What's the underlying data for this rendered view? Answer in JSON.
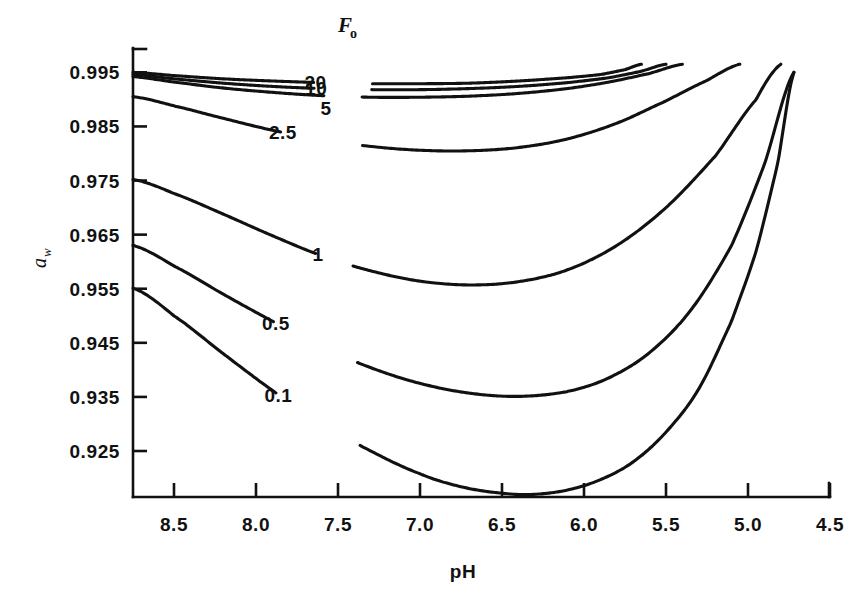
{
  "chart_data": {
    "type": "line",
    "title": "",
    "xlabel": "pH",
    "ylabel": "a_w",
    "ylabel_base": "a",
    "ylabel_sub": "w",
    "legend_title": "F",
    "legend_title_sub": "o",
    "legend_position": "inline-on-curves",
    "grid": false,
    "x_direction": "descending",
    "xlim": [
      8.75,
      4.5
    ],
    "ylim": [
      0.9165,
      0.9995
    ],
    "xticks": [
      "8.5",
      "8.0",
      "7.5",
      "7.0",
      "6.5",
      "6.0",
      "5.5",
      "5.0",
      "4.5"
    ],
    "xtick_values": [
      8.5,
      8.0,
      7.5,
      7.0,
      6.5,
      6.0,
      5.5,
      5.0,
      4.5
    ],
    "yticks": [
      "0.995",
      "0.985",
      "0.975",
      "0.965",
      "0.955",
      "0.945",
      "0.935",
      "0.925"
    ],
    "ytick_values": [
      0.995,
      0.985,
      0.975,
      0.965,
      0.955,
      0.945,
      0.935,
      0.925
    ],
    "series": [
      {
        "name": "20",
        "label": "20",
        "x": [
          8.75,
          8.5,
          8.2,
          7.9,
          7.6,
          7.3,
          7.0,
          6.7,
          6.4,
          6.1,
          5.9,
          5.75,
          5.65
        ],
        "y": [
          0.995,
          0.9944,
          0.9938,
          0.9934,
          0.9931,
          0.9929,
          0.9929,
          0.993,
          0.9934,
          0.994,
          0.9946,
          0.9955,
          0.9965
        ]
      },
      {
        "name": "10",
        "label": "10",
        "x": [
          8.75,
          8.5,
          8.2,
          7.9,
          7.6,
          7.3,
          7.0,
          6.7,
          6.4,
          6.1,
          5.85,
          5.65,
          5.5
        ],
        "y": [
          0.9946,
          0.9938,
          0.993,
          0.9924,
          0.992,
          0.9918,
          0.9918,
          0.992,
          0.9924,
          0.9931,
          0.994,
          0.9952,
          0.9965
        ]
      },
      {
        "name": "5",
        "label": "5",
        "x": [
          8.75,
          8.5,
          8.2,
          7.9,
          7.6,
          7.3,
          7.0,
          6.7,
          6.4,
          6.1,
          5.85,
          5.6,
          5.4
        ],
        "y": [
          0.9942,
          0.9932,
          0.9921,
          0.9913,
          0.9907,
          0.9904,
          0.9904,
          0.9906,
          0.9911,
          0.992,
          0.9932,
          0.9948,
          0.9965
        ]
      },
      {
        "name": "2.5",
        "label": "2.5",
        "x": [
          8.75,
          8.5,
          8.2,
          7.9,
          7.6,
          7.3,
          7.0,
          6.7,
          6.4,
          6.1,
          5.8,
          5.5,
          5.25,
          5.05
        ],
        "y": [
          0.9905,
          0.9888,
          0.9865,
          0.9843,
          0.9826,
          0.9813,
          0.9806,
          0.9805,
          0.9811,
          0.9827,
          0.9856,
          0.9897,
          0.9935,
          0.9965
        ]
      },
      {
        "name": "1",
        "label": "1",
        "x": [
          8.75,
          8.5,
          8.2,
          7.9,
          7.6,
          7.3,
          7.0,
          6.7,
          6.4,
          6.1,
          5.8,
          5.5,
          5.2,
          4.95,
          4.8
        ],
        "y": [
          0.9752,
          0.9726,
          0.9688,
          0.9648,
          0.9611,
          0.9583,
          0.9564,
          0.9557,
          0.9563,
          0.9585,
          0.963,
          0.97,
          0.9795,
          0.99,
          0.9965
        ]
      },
      {
        "name": "0.5",
        "label": "0.5",
        "x": [
          8.75,
          8.5,
          8.2,
          7.9,
          7.6,
          7.3,
          7.0,
          6.7,
          6.4,
          6.1,
          5.85,
          5.6,
          5.35,
          5.1,
          4.9,
          4.72
        ],
        "y": [
          0.963,
          0.9592,
          0.954,
          0.949,
          0.9443,
          0.9404,
          0.9375,
          0.9357,
          0.9351,
          0.936,
          0.9385,
          0.9432,
          0.951,
          0.963,
          0.978,
          0.995
        ]
      },
      {
        "name": "0.1",
        "label": "0.1",
        "x": [
          8.75,
          8.5,
          8.2,
          7.9,
          7.6,
          7.3,
          7.0,
          6.75,
          6.5,
          6.3,
          6.1,
          5.9,
          5.7,
          5.5,
          5.3,
          5.1,
          4.95,
          4.82,
          4.72
        ],
        "y": [
          0.9551,
          0.95,
          0.943,
          0.9362,
          0.9301,
          0.925,
          0.9208,
          0.9184,
          0.9172,
          0.917,
          0.9178,
          0.9197,
          0.923,
          0.9285,
          0.9365,
          0.949,
          0.962,
          0.978,
          0.995
        ]
      }
    ]
  },
  "axes": {
    "y_title_main": "a",
    "y_title_sub": "w",
    "x_title": "pH"
  },
  "legend": {
    "title_main": "F",
    "title_sub": "o",
    "entries": [
      "20",
      "10",
      "5"
    ]
  },
  "colors": {
    "ink": "#111111",
    "background": "#ffffff"
  }
}
